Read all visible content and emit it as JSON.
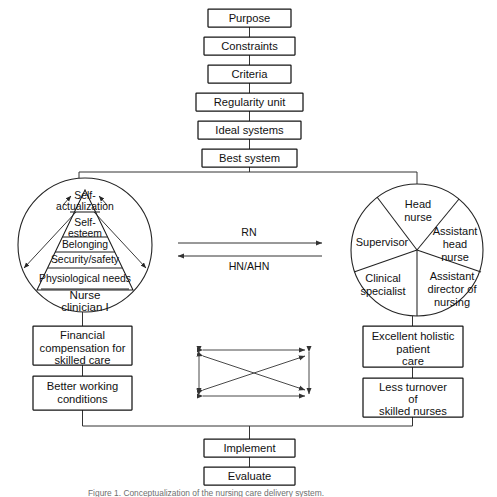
{
  "figure": {
    "caption": "Figure 1. Conceptualization of the nursing care delivery system."
  },
  "top_chain": {
    "items": [
      {
        "label": "Purpose"
      },
      {
        "label": "Constraints"
      },
      {
        "label": "Criteria"
      },
      {
        "label": "Regularity unit"
      },
      {
        "label": "Ideal systems"
      },
      {
        "label": "Best system"
      }
    ]
  },
  "left_circle": {
    "name": "Nurse clinician circle",
    "pyramid": {
      "tiers": [
        {
          "lines": [
            "Self-",
            "actualization"
          ]
        },
        {
          "lines": [
            "Self-",
            "esteem"
          ]
        },
        {
          "lines": [
            "Belonging"
          ]
        },
        {
          "lines": [
            "Security/safety"
          ]
        },
        {
          "lines": [
            "Physiological needs"
          ]
        }
      ]
    },
    "label_lines": [
      "Nurse",
      "clinician I"
    ]
  },
  "right_circle": {
    "name": "Nursing management circle",
    "sectors": [
      {
        "lines": [
          "Head",
          "nurse"
        ]
      },
      {
        "lines": [
          "Assistant",
          "head",
          "nurse"
        ]
      },
      {
        "lines": [
          "Assistant",
          "director of",
          "nursing"
        ]
      },
      {
        "lines": [
          "Clinical",
          "specialist"
        ]
      },
      {
        "lines": [
          "Supervisor"
        ]
      }
    ]
  },
  "exchange_arrows": {
    "top_label": "RN",
    "bottom_label": "HN/AHN"
  },
  "left_outcomes": [
    {
      "lines": [
        "Financial",
        "compensation for",
        "skilled care"
      ]
    },
    {
      "lines": [
        "Better working",
        "conditions"
      ]
    }
  ],
  "right_outcomes": [
    {
      "lines": [
        "Excellent holistic",
        "patient",
        "care"
      ]
    },
    {
      "lines": [
        "Less turnover",
        "of",
        "skilled nurses"
      ]
    }
  ],
  "bottom_chain": {
    "items": [
      {
        "label": "Implement"
      },
      {
        "label": "Evaluate"
      }
    ]
  },
  "colors": {
    "ink": "#151515",
    "line": "#333333",
    "background": "#ffffff",
    "caption": "#6f6f6f"
  }
}
